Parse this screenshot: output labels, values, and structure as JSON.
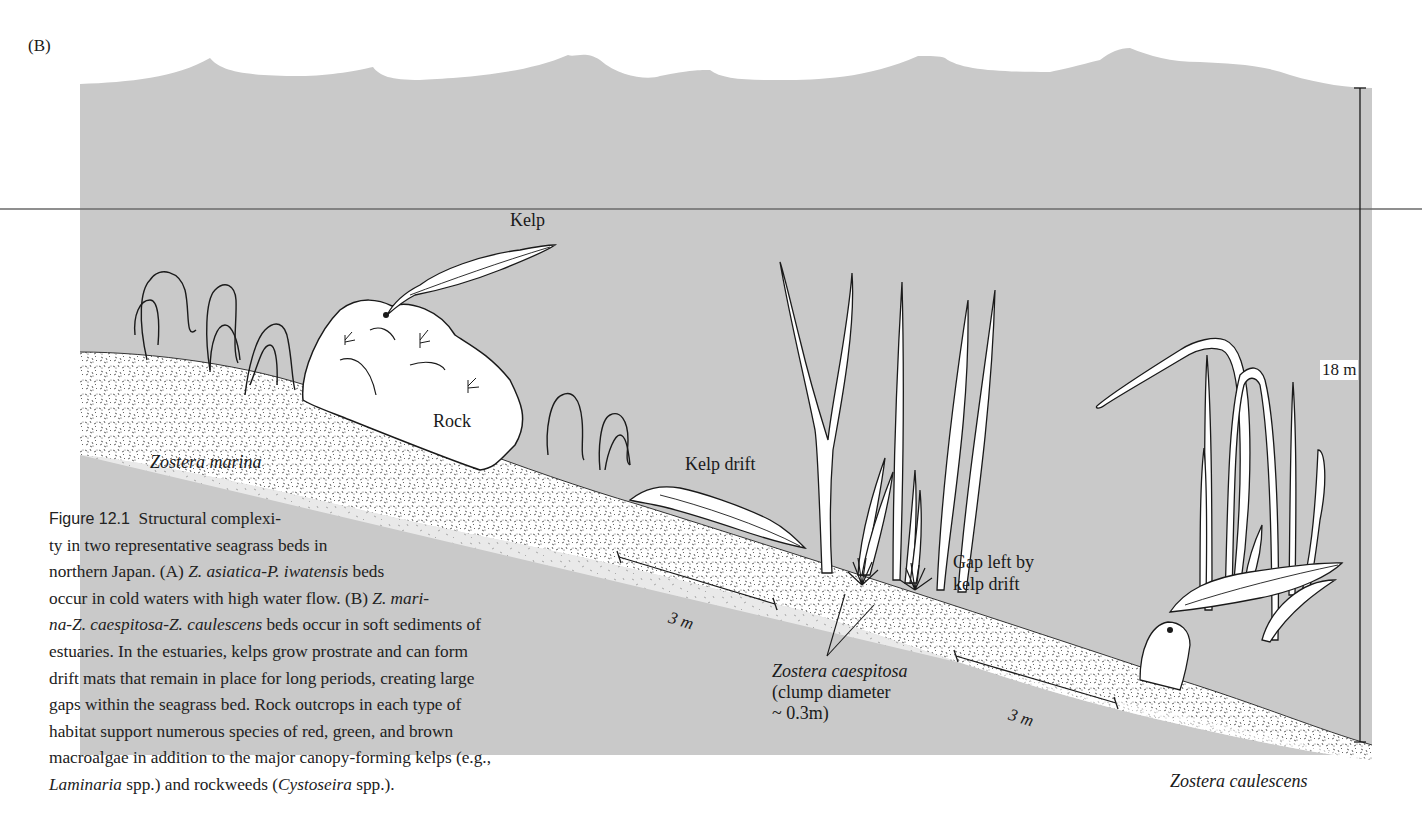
{
  "figure": {
    "panel_label": "(B)",
    "colors": {
      "water": "#c9c9c9",
      "sediment_speckle": "#555555",
      "outline": "#1a1a1a",
      "background": "#ffffff"
    },
    "labels": {
      "kelp": "Kelp",
      "rock": "Rock",
      "kelp_drift": "Kelp drift",
      "gap": [
        "Gap left by",
        "kelp drift"
      ],
      "zostera_marina": "Zostera marina",
      "zostera_caespitosa": "Zostera caespitosa",
      "clump_diameter": [
        "(clump diameter",
        "~ 0.3m)"
      ],
      "zostera_caulescens": "Zostera caulescens",
      "depth_scale": "18 m",
      "scale_bar_1": "3 m",
      "scale_bar_2": "3 m"
    }
  },
  "caption": {
    "figure_number": "Figure 12.1",
    "lines": [
      {
        "parts": [
          {
            "t": "Structural complexi-",
            "i": false
          }
        ]
      },
      {
        "parts": [
          {
            "t": "ty in two representative seagrass beds in",
            "i": false
          }
        ]
      },
      {
        "parts": [
          {
            "t": "northern Japan. (A) ",
            "i": false
          },
          {
            "t": "Z. asiatica-P. iwatensis",
            "i": true
          },
          {
            "t": " beds",
            "i": false
          }
        ]
      },
      {
        "parts": [
          {
            "t": "occur in cold waters with high water flow. (B) ",
            "i": false
          },
          {
            "t": "Z. mari-",
            "i": true
          }
        ]
      },
      {
        "parts": [
          {
            "t": "na-Z. caespitosa-Z. caulescens",
            "i": true
          },
          {
            "t": " beds occur in soft sediments of",
            "i": false
          }
        ]
      },
      {
        "parts": [
          {
            "t": "estuaries. In the estuaries, kelps grow prostrate and can form",
            "i": false
          }
        ]
      },
      {
        "parts": [
          {
            "t": "drift mats that remain in place for long periods, creating large",
            "i": false
          }
        ]
      },
      {
        "parts": [
          {
            "t": "gaps within the seagrass bed. Rock outcrops in each type of",
            "i": false
          }
        ]
      },
      {
        "parts": [
          {
            "t": "habitat support numerous species of red, green, and brown",
            "i": false
          }
        ]
      },
      {
        "parts": [
          {
            "t": "macroalgae in addition to the major canopy-forming kelps (e.g.,",
            "i": false
          }
        ]
      },
      {
        "parts": [
          {
            "t": "Laminaria",
            "i": true
          },
          {
            "t": " spp.) and rockweeds (",
            "i": false
          },
          {
            "t": "Cystoseira",
            "i": true
          },
          {
            "t": " spp.).",
            "i": false
          }
        ]
      }
    ]
  }
}
